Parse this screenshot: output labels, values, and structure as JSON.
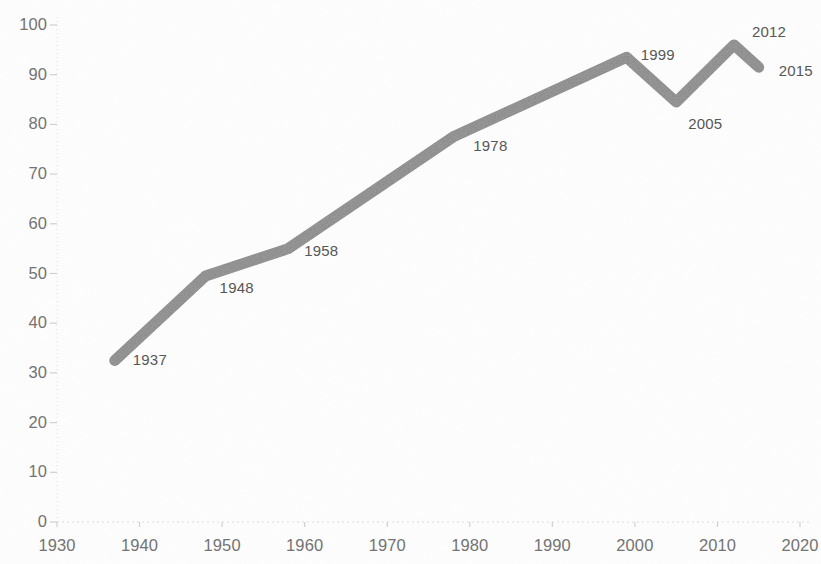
{
  "chart_data": {
    "type": "line",
    "title": "",
    "subtitle": "",
    "xlabel": "",
    "ylabel": "",
    "x": [
      1937,
      1948,
      1958,
      1978,
      1999,
      2005,
      2012,
      2015
    ],
    "values": [
      32.5,
      49.5,
      55,
      77.5,
      93.5,
      84.5,
      96,
      91.5
    ],
    "point_labels": [
      "1937",
      "1948",
      "1958",
      "1978",
      "1999",
      "2005",
      "2012",
      "2015"
    ],
    "xlim": [
      1930,
      2020
    ],
    "ylim": [
      0,
      100
    ],
    "x_ticks": [
      1930,
      1940,
      1950,
      1960,
      1970,
      1980,
      1990,
      2000,
      2010,
      2020
    ],
    "x_tick_labels": [
      "1930",
      "1940",
      "1950",
      "1960",
      "1970",
      "1980",
      "1990",
      "2000",
      "2010",
      "2020"
    ],
    "y_ticks": [
      0,
      10,
      20,
      30,
      40,
      50,
      60,
      70,
      80,
      90,
      100
    ],
    "y_tick_labels": [
      "0",
      "10",
      "20",
      "30",
      "40",
      "50",
      "60",
      "70",
      "80",
      "90",
      "100"
    ],
    "grid": false,
    "legend": null,
    "series": [
      {
        "name": "series-1",
        "color": "#9c9c9c",
        "line_width": 11,
        "values": [
          32.5,
          49.5,
          55,
          77.5,
          93.5,
          84.5,
          96,
          91.5
        ]
      }
    ],
    "label_offsets": [
      {
        "dx": 18,
        "dy": 0
      },
      {
        "dx": 14,
        "dy": 12
      },
      {
        "dx": 16,
        "dy": 2
      },
      {
        "dx": 20,
        "dy": 9
      },
      {
        "dx": 14,
        "dy": -2
      },
      {
        "dx": 12,
        "dy": 22
      },
      {
        "dx": 18,
        "dy": -13
      },
      {
        "dx": 20,
        "dy": 4
      }
    ]
  },
  "axes": {
    "x_axis_color": "#d9d9d9",
    "y_axis_color": "#d9d9d9",
    "tick_color": "#d0d0d0",
    "label_color": "#737373"
  },
  "canvas": {
    "background": "#ffffff",
    "width": 821,
    "height": 564,
    "plot_left": 57,
    "plot_right": 800,
    "plot_top": 25,
    "plot_bottom": 522
  }
}
